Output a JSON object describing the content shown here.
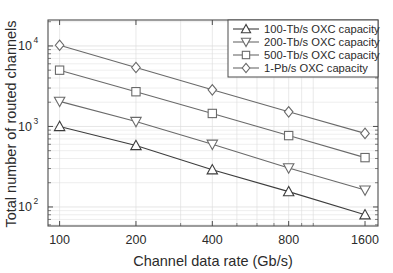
{
  "chart_data": {
    "type": "line",
    "title": "",
    "xlabel": "Channel data rate (Gb/s)",
    "ylabel": "Total number of routed channels",
    "xscale": "log",
    "yscale": "log",
    "x": [
      100,
      200,
      400,
      800,
      1600
    ],
    "xtick_labels": [
      "100",
      "200",
      "400",
      "800",
      "1600"
    ],
    "ytick_labels": [
      "10^2",
      "10^3",
      "10^4"
    ],
    "ytick_values": [
      100,
      1000,
      10000
    ],
    "xlim": [
      90,
      1800
    ],
    "ylim": [
      58,
      21000
    ],
    "grid": true,
    "legend_position": "top-right",
    "series": [
      {
        "name": "100-Tb/s OXC capacity",
        "marker": "triangle-up",
        "color": "#3d3d3d",
        "values": [
          1000,
          580,
          290,
          155,
          80
        ]
      },
      {
        "name": "200-Tb/s OXC capacity",
        "marker": "triangle-down",
        "color": "#6a6a6a",
        "values": [
          2050,
          1150,
          600,
          305,
          162
        ]
      },
      {
        "name": "500-Tb/s OXC capacity",
        "marker": "square",
        "color": "#6a6a6a",
        "values": [
          5000,
          2700,
          1450,
          770,
          410
        ]
      },
      {
        "name": "1-Pb/s OXC capacity",
        "marker": "diamond",
        "color": "#6a6a6a",
        "values": [
          10200,
          5400,
          2850,
          1520,
          820
        ]
      }
    ]
  },
  "axes": {
    "x_axis_label": "Channel data rate (Gb/s)",
    "y_axis_label": "Total number of routed channels",
    "x_ticks": [
      "100",
      "200",
      "400",
      "800",
      "1600"
    ],
    "y_ticks": [
      {
        "mantissa": "10",
        "exponent": "2"
      },
      {
        "mantissa": "10",
        "exponent": "3"
      },
      {
        "mantissa": "10",
        "exponent": "4"
      }
    ]
  },
  "legend": {
    "items": [
      {
        "label": "100-Tb/s OXC capacity",
        "marker": "triangle-up"
      },
      {
        "label": "200-Tb/s OXC capacity",
        "marker": "triangle-down"
      },
      {
        "label": "500-Tb/s OXC capacity",
        "marker": "square"
      },
      {
        "label": "1-Pb/s OXC capacity",
        "marker": "diamond"
      }
    ]
  },
  "style": {
    "axis_color": "#4d4d4d",
    "grid_color": "#dcdcdc",
    "background": "#ffffff"
  }
}
